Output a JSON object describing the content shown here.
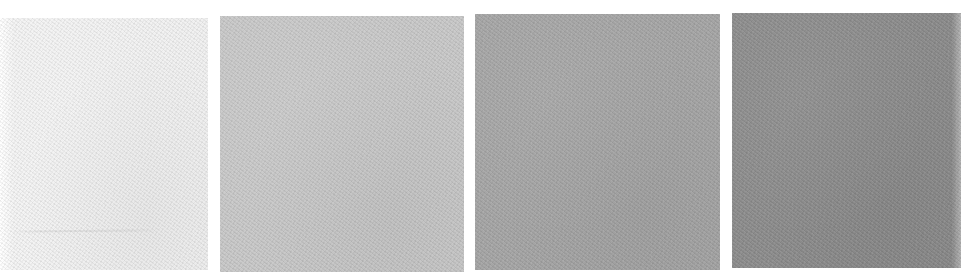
{
  "image": {
    "description": "Four scanned paper texture swatches arranged horizontally, progressing from near-white to medium-dark gray",
    "background": "#ffffff",
    "swatches": [
      {
        "index": 1,
        "tone": "very light gray",
        "color": "#f0f0f0"
      },
      {
        "index": 2,
        "tone": "light gray",
        "color": "#c8c8c8"
      },
      {
        "index": 3,
        "tone": "medium gray",
        "color": "#a5a5a5"
      },
      {
        "index": 4,
        "tone": "dark gray",
        "color": "#8b8b8b"
      }
    ]
  }
}
